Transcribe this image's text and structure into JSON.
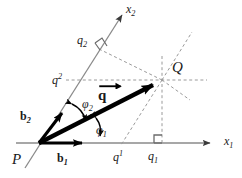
{
  "figure": {
    "width": 242,
    "height": 178,
    "background_color": "#ffffff",
    "colors": {
      "axis": "#8a8a8a",
      "vector": "#000000",
      "dashed": "#9a9a9a",
      "text": "#1a1a1a"
    }
  },
  "labels": {
    "origin": "P",
    "point_q": "Q",
    "axis_x1": {
      "base": "x",
      "sub": "1"
    },
    "axis_x2": {
      "base": "x",
      "sub": "2"
    },
    "basis_b1": {
      "base": "b",
      "sub": "1"
    },
    "basis_b2": {
      "base": "b",
      "sub": "2"
    },
    "vector_q": "q",
    "angle_phi1": {
      "base": "φ",
      "sub": "1"
    },
    "angle_phi2": {
      "base": "φ",
      "sub": "2"
    },
    "contravariant_q1": {
      "base": "q",
      "sup": "1"
    },
    "contravariant_q2": {
      "base": "q",
      "sup": "2"
    },
    "covariant_q1": {
      "base": "q",
      "sub": "1"
    },
    "covariant_q2": {
      "base": "q",
      "sub": "2"
    }
  },
  "geometry": {
    "origin": {
      "x": 39,
      "y": 143
    },
    "point_q": {
      "x": 162,
      "y": 80
    },
    "axis_x1_tip": {
      "x": 219,
      "y": 143
    },
    "axis_x2_tip": {
      "x": 118,
      "y": 9
    },
    "basis_b1_tip": {
      "x": 89,
      "y": 143
    },
    "basis_b2_tip": {
      "x": 67,
      "y": 108
    },
    "foot_covariant_x1": {
      "x": 162,
      "y": 143
    },
    "foot_contravariant_x1": {
      "x": 120,
      "y": 143
    },
    "foot_covariant_x2": {
      "x": 100,
      "y": 48
    },
    "foot_contravariant_x2": {
      "x": 78,
      "y": 81
    }
  }
}
